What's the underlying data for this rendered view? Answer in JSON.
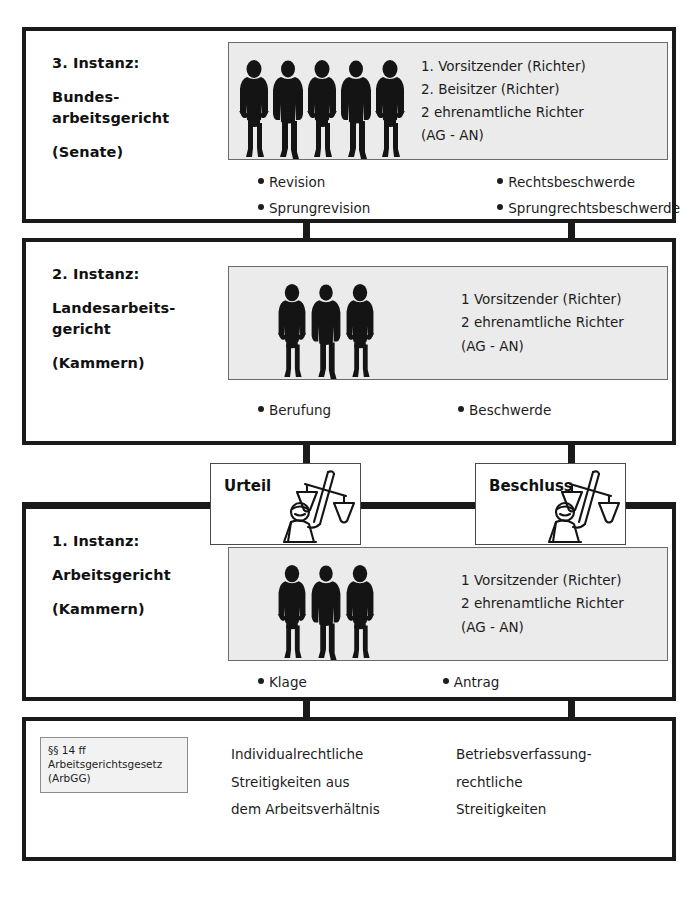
{
  "diagram": {
    "colors": {
      "border": "#1a1a1a",
      "bench_fill": "#ebebeb",
      "bench_border": "#6a6a6a",
      "statute_fill": "#f2f2f2",
      "text": "#1d1d1d",
      "background": "#ffffff"
    }
  },
  "levels": [
    {
      "id": "instanz-3",
      "caption": {
        "line1": "3. Instanz:",
        "line2": "Bundes-",
        "line3": "arbeitsgericht",
        "line4": "(Senate)"
      },
      "bench": {
        "figure_count": 5,
        "composition": [
          "1. Vorsitzender (Richter)",
          "2. Beisitzer (Richter)",
          "2 ehrenamtliche Richter",
          "(AG - AN)"
        ]
      },
      "remedies_left": [
        "Revision",
        "Sprungrevision"
      ],
      "remedies_right": [
        "Rechtsbeschwerde",
        "Sprungrechtsbeschwerde"
      ]
    },
    {
      "id": "instanz-2",
      "caption": {
        "line1": "2. Instanz:",
        "line2": "Landesarbeits-",
        "line3": "gericht",
        "line4": "(Kammern)"
      },
      "bench": {
        "figure_count": 3,
        "composition": [
          "1 Vorsitzender (Richter)",
          "2 ehrenamtliche Richter",
          "(AG - AN)"
        ]
      },
      "remedies_left": [
        "Berufung"
      ],
      "remedies_right": [
        "Beschwerde"
      ]
    },
    {
      "id": "instanz-1",
      "caption": {
        "line1": "1. Instanz:",
        "line2": "Arbeitsgericht",
        "line3": "",
        "line4": "(Kammern)"
      },
      "bench": {
        "figure_count": 3,
        "composition": [
          "1 Vorsitzender (Richter)",
          "2 ehrenamtliche Richter",
          "(AG - AN)"
        ]
      },
      "remedies_left": [
        "Klage"
      ],
      "remedies_right": [
        "Antrag"
      ]
    }
  ],
  "decisions": {
    "left": {
      "label": "Urteil",
      "icon": "scales-of-justice-icon"
    },
    "right": {
      "label": "Beschluss",
      "icon": "scales-of-justice-icon"
    }
  },
  "foundation": {
    "statute": {
      "line1": "§§ 14 ff",
      "line2": "Arbeitsgerichtsgesetz",
      "line3": "(ArbGG)"
    },
    "subject_left": {
      "line1": "Individualrechtliche",
      "line2": "Streitigkeiten aus",
      "line3": "dem Arbeitsverhältnis"
    },
    "subject_right": {
      "line1": "Betriebsverfassung-",
      "line2": "rechtliche",
      "line3": "Streitigkeiten"
    }
  }
}
